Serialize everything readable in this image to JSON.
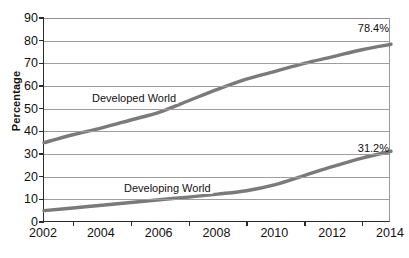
{
  "chart_data": {
    "type": "line",
    "title": "",
    "xlabel": "",
    "ylabel": "Percentage",
    "xlim": [
      2002,
      2014
    ],
    "ylim": [
      0,
      90
    ],
    "grid": true,
    "legend_position": "inline-annotations",
    "line_color": "#7a7a7a",
    "axis_color": "#2b2b2b",
    "grid_color": "#9d9d9d",
    "x": [
      2002,
      2003,
      2004,
      2005,
      2006,
      2007,
      2008,
      2009,
      2010,
      2011,
      2012,
      2013,
      2014
    ],
    "xticks": [
      "2002",
      "2004",
      "2006",
      "2008",
      "2010",
      "2012",
      "2014"
    ],
    "xtick_values": [
      2002,
      2004,
      2006,
      2008,
      2010,
      2012,
      2014
    ],
    "yticks": [
      "0",
      "10",
      "20",
      "30",
      "40",
      "50",
      "60",
      "70",
      "80",
      "90"
    ],
    "ytick_values": [
      0,
      10,
      20,
      30,
      40,
      50,
      60,
      70,
      80,
      90
    ],
    "series": [
      {
        "name": "Developed World",
        "inline_label": "Developed World",
        "end_label": "78.4%",
        "end_value": 78.4,
        "values": [
          35.0,
          38.5,
          41.5,
          45.0,
          48.5,
          53.5,
          58.5,
          63.0,
          66.5,
          70.0,
          73.0,
          76.0,
          78.4
        ]
      },
      {
        "name": "Developing World",
        "inline_label": "Developing World",
        "end_label": "31.2%",
        "end_value": 31.2,
        "values": [
          5.0,
          6.2,
          7.4,
          8.6,
          9.8,
          11.0,
          12.3,
          13.8,
          16.5,
          20.5,
          24.5,
          28.2,
          31.2
        ]
      }
    ]
  }
}
